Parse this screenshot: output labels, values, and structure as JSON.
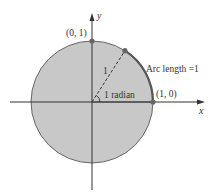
{
  "diagram": {
    "labels": {
      "y_axis": "y",
      "x_axis": "x",
      "point_top": "(0, 1)",
      "point_right": "(1, 0)",
      "radius": "1",
      "angle": "1 radian",
      "arc": "Arc length =1"
    },
    "colors": {
      "disk_fill": "#c8c8c8",
      "outline": "#555555",
      "arc_highlight": "#555555",
      "axes": "#333333",
      "points": "#666666"
    }
  }
}
